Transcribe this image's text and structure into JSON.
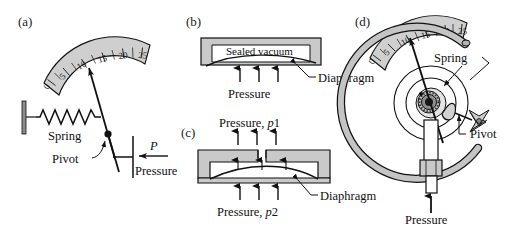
{
  "figure": {
    "background_color": "#ffffff",
    "stroke_color": "#111111",
    "fill_gray": "#c9c9c9",
    "fill_gray_dark": "#9a9a9a",
    "fill_white": "#ffffff"
  },
  "panels": [
    {
      "id": "a",
      "label": "(a)",
      "name": "spring-pressure-gauge",
      "scale": {
        "name": "dial-scale",
        "ticks": [
          "0",
          "5",
          "10",
          "15",
          "20",
          "25"
        ],
        "minor_ticks_between": 1
      },
      "labels": {
        "spring": "Spring",
        "pivot": "Pivot",
        "pressure": "Pressure",
        "pressure_symbol": "P"
      }
    },
    {
      "id": "b",
      "label": "(b)",
      "name": "sealed-vacuum-diaphragm",
      "labels": {
        "chamber": "Sealed vacuum",
        "diaphragm": "Diaphragm",
        "pressure": "Pressure"
      },
      "arrow_count": 3
    },
    {
      "id": "c",
      "label": "(c)",
      "name": "differential-pressure-diaphragm",
      "labels": {
        "pressure_top": "Pressure,",
        "pressure_top_symbol": "p",
        "pressure_top_index": "1",
        "pressure_bottom": "Pressure,",
        "pressure_bottom_symbol": "p",
        "pressure_bottom_index": "2",
        "diaphragm": "Diaphragm"
      },
      "arrow_count_top": 3,
      "arrow_count_inner": 3,
      "arrow_count_bottom": 3
    },
    {
      "id": "d",
      "label": "(d)",
      "name": "bourdon-tube-gauge",
      "scale": {
        "name": "dial-scale",
        "ticks": [
          "0",
          "5",
          "10",
          "15",
          "20",
          "25"
        ]
      },
      "labels": {
        "spring": "Spring",
        "pivot": "Pivot",
        "pressure": "Pressure"
      }
    }
  ]
}
